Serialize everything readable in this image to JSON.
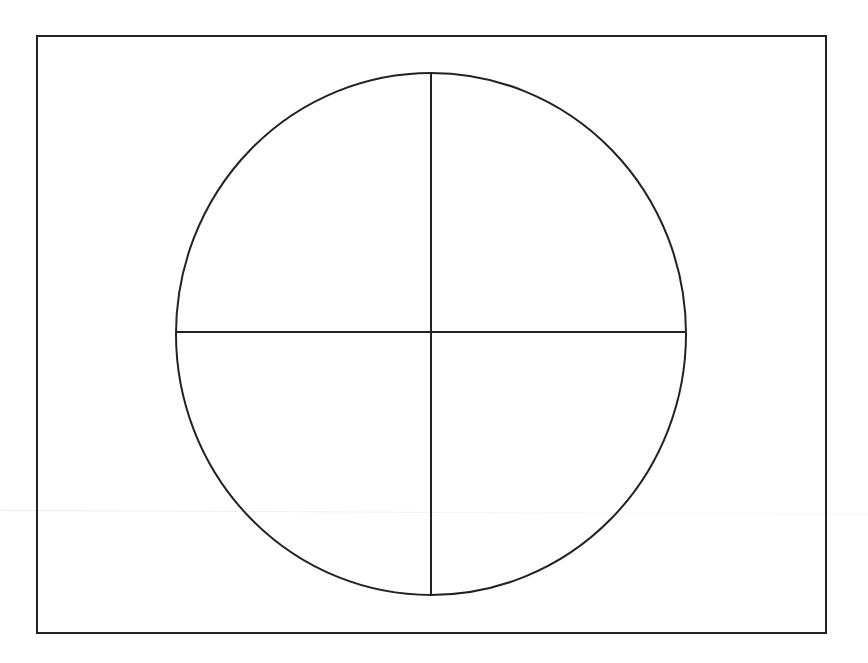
{
  "diagram": {
    "title": "",
    "stroke_color": "#222222",
    "background_color": "#ffffff",
    "stroke_width": 2,
    "frame": {
      "x": 37,
      "y": 36,
      "width": 789,
      "height": 597
    },
    "circle": {
      "cx": 431,
      "cy": 334,
      "rx": 255,
      "ry": 261
    },
    "vertical_line": {
      "x1": 431,
      "y1": 73,
      "x2": 431,
      "y2": 595
    },
    "horizontal_line": {
      "x1": 176,
      "y1": 332,
      "x2": 686,
      "y2": 332
    },
    "quadrants": [
      "top-left",
      "top-right",
      "bottom-left",
      "bottom-right"
    ],
    "labels": []
  }
}
